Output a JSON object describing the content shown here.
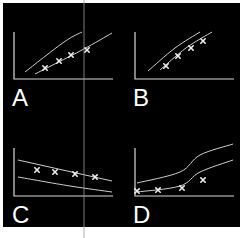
{
  "figure": {
    "background": "#000000",
    "border_color": "#ffffff",
    "line_color": "#d8d8d8",
    "marker_color": "#e8e8e8",
    "marker": "x",
    "overlay_line_color": "#9a9a9a",
    "overlay_line_x": 84
  },
  "panels": [
    {
      "id": "A",
      "label": "A"
    },
    {
      "id": "B",
      "label": "B"
    },
    {
      "id": "C",
      "label": "C"
    },
    {
      "id": "D",
      "label": "D"
    }
  ],
  "chart_data": [
    {
      "type": "scatter",
      "title": "A",
      "description": "Two roughly linear diverging reference lines; four x-marked points lying between/below the lines",
      "reference_lines": [
        {
          "name": "upper",
          "points": [
            [
              25,
              72
            ],
            [
              64,
              42
            ],
            [
              82,
              32
            ]
          ]
        },
        {
          "name": "lower",
          "points": [
            [
              35,
              74
            ],
            [
              82,
              50
            ],
            [
              112,
              33
            ]
          ]
        }
      ],
      "points": [
        [
          45,
          68
        ],
        [
          59,
          61
        ],
        [
          71,
          55
        ],
        [
          87,
          50
        ]
      ],
      "xlabel": "",
      "ylabel": "",
      "grid": false
    },
    {
      "type": "scatter",
      "title": "B",
      "description": "Two parallel concave curves; four x-marked points lying on the lower curve",
      "reference_lines": [
        {
          "name": "upper",
          "points": [
            [
              148,
              71
            ],
            [
              175,
              48
            ],
            [
              200,
              32
            ]
          ]
        },
        {
          "name": "lower",
          "points": [
            [
              160,
              70
            ],
            [
              186,
              48
            ],
            [
              212,
              32
            ]
          ]
        }
      ],
      "points": [
        [
          166,
          66
        ],
        [
          178,
          56
        ],
        [
          191,
          48
        ],
        [
          203,
          41
        ]
      ],
      "xlabel": "",
      "ylabel": "",
      "grid": false
    },
    {
      "type": "scatter",
      "title": "C",
      "description": "Two gently decreasing lines; four x-marked points lying along the upper line",
      "reference_lines": [
        {
          "name": "upper",
          "points": [
            [
              18,
              160
            ],
            [
              112,
              181
            ]
          ]
        },
        {
          "name": "lower",
          "points": [
            [
              18,
              177
            ],
            [
              70,
              186
            ],
            [
              112,
              192
            ]
          ]
        }
      ],
      "points": [
        [
          37,
          170
        ],
        [
          55,
          172
        ],
        [
          75,
          174
        ],
        [
          95,
          177
        ]
      ],
      "xlabel": "",
      "ylabel": "",
      "grid": false
    },
    {
      "type": "scatter",
      "title": "D",
      "description": "Two sigmoid-like increasing curves; four x-marked points near the lower curve, last point above it",
      "reference_lines": [
        {
          "name": "upper",
          "points": [
            [
              137,
              183
            ],
            [
              180,
              172
            ],
            [
              200,
              155
            ],
            [
              233,
              144
            ]
          ]
        },
        {
          "name": "lower",
          "points": [
            [
              137,
              192
            ],
            [
              180,
              186
            ],
            [
              200,
              172
            ],
            [
              233,
              160
            ]
          ]
        }
      ],
      "points": [
        [
          137,
          191
        ],
        [
          158,
          190
        ],
        [
          182,
          188
        ],
        [
          203,
          180
        ]
      ],
      "xlabel": "",
      "ylabel": "",
      "grid": false
    }
  ]
}
